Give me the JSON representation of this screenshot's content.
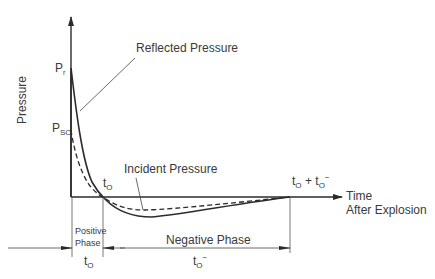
{
  "diagram": {
    "title": "",
    "y_axis_label": "Pressure",
    "x_axis_label_line1": "Time",
    "x_axis_label_line2": "After Explosion",
    "labels": {
      "reflected_pressure": "Reflected Pressure",
      "incident_pressure": "Incident Pressure",
      "pr_main": "P",
      "pr_sub": "r",
      "pso_main": "P",
      "pso_sub": "SO",
      "t0_main": "t",
      "t0_sub": "O",
      "end_t0_main": "t",
      "end_t0_sub": "O",
      "end_plus": "+",
      "end_t0neg_main": "t",
      "end_t0neg_sub": "O",
      "end_t0neg_sup": "−",
      "positive_phase_line1": "Positive",
      "positive_phase_line2": "Phase",
      "negative_phase": "Negative Phase",
      "dur_pos_main": "t",
      "dur_pos_sub": "O",
      "dur_neg_main": "t",
      "dur_neg_sub": "O",
      "dur_neg_sup": "−"
    },
    "series": [
      {
        "name": "Reflected Pressure",
        "style": "solid"
      },
      {
        "name": "Incident Pressure",
        "style": "dashed"
      }
    ],
    "colors": {
      "line": "#2b2b2b",
      "text": "#3a3a3a",
      "background": "#ffffff"
    }
  }
}
